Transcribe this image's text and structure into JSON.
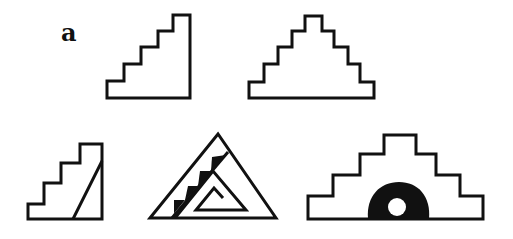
{
  "figure": {
    "panel_label": "a",
    "stroke_color": "#111111",
    "fill_color": "#ffffff",
    "motifs": [
      {
        "id": 1,
        "name": "ascending-staircase",
        "description": "Stepped half-pyramid (4 steps) rising to the right"
      },
      {
        "id": 2,
        "name": "stepped-pyramid",
        "description": "Symmetric stepped pyramid outline"
      },
      {
        "id": 3,
        "name": "staircase-with-diagonal",
        "description": "Staircase with diagonal line on right side"
      },
      {
        "id": 4,
        "name": "triangle-with-steps-and-spiral",
        "description": "Triangle with black stepped band and inner triangular spiral"
      },
      {
        "id": 5,
        "name": "pyramid-with-dome",
        "description": "Stepped pyramid with black dome containing white circle at base"
      }
    ]
  }
}
